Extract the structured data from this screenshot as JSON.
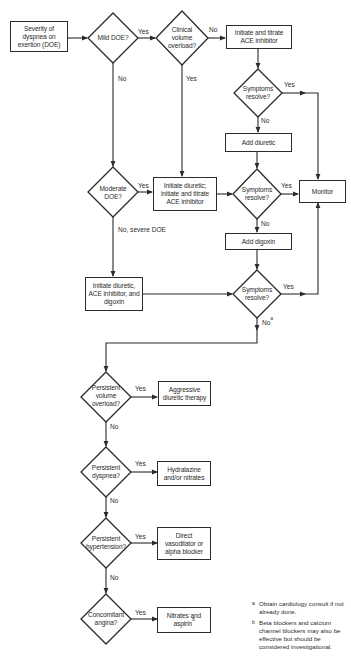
{
  "flowchart": {
    "start": {
      "label": "Severity of dyspnea on exertion (DOE)"
    },
    "decisions": {
      "mild_doe": "Mild DOE?",
      "clinical_volume_overload": "Clinical volume overload?",
      "symptoms_resolve_1": "Symptoms resolve?",
      "moderate_doe": "Moderate DOE?",
      "symptoms_resolve_2": "Symptoms resolve?",
      "symptoms_resolve_3": "Symptoms resolve?",
      "persistent_volume_overload": "Persistent volume overload?",
      "persistent_dyspnea": "Persistent dyspnea?",
      "persistent_hypertension": "Persistent hypertension?",
      "concomitant_angina": "Concomitant angina?"
    },
    "actions": {
      "initiate_titrate_ace": "Initiate and titrate ACE inhibitor",
      "add_diuretic": "Add diuretic",
      "initiate_diuretic_titrate_ace": "Initiate diuretic; initiate and titrate ACE inhibitor",
      "monitor": "Monitor",
      "add_digoxin": "Add digoxin",
      "initiate_diuretic_ace_digoxin": "Initiate diuretic, ACE inhibitor, and digoxin",
      "aggressive_diuretic": "Aggressive diuretic therapy",
      "hydralazine_nitrates": "Hydralazine and/or nitrates",
      "direct_vasodilator": "Direct vasodilator or alpha blocker",
      "nitrates_aspirin": "Nitrates and aspirin",
      "nitrates_aspirin_sup": "b"
    },
    "edge_labels": {
      "yes": "Yes",
      "no": "No",
      "no_severe": "No, severe DOE",
      "no_a": "No",
      "no_a_sup": "a"
    },
    "footnotes": [
      {
        "marker": "a",
        "text": "Obtain cardiology consult if not already done."
      },
      {
        "marker": "b",
        "text": "Beta blockers and calcium channel blockers may also be effective but should be considered investigational."
      }
    ]
  }
}
